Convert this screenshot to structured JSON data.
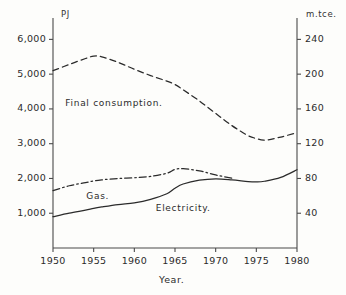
{
  "chart_data": {
    "type": "line",
    "title": "",
    "xlabel": "Year.",
    "ylabel": "PJ",
    "ylabel_right": "m.tce.",
    "xlim": [
      1950,
      1980
    ],
    "ylim": [
      0,
      6500
    ],
    "ylim_right": [
      0,
      260
    ],
    "grid": false,
    "legend": "inline-annotations",
    "xticks": [
      1950,
      1955,
      1960,
      1965,
      1970,
      1975,
      1980
    ],
    "xtick_labels": [
      "1950",
      "1955",
      "1960",
      "1965",
      "1970",
      "1975",
      "1980"
    ],
    "yticks": [
      1000,
      2000,
      3000,
      4000,
      5000,
      6000
    ],
    "ytick_labels": [
      "1,000",
      "2,000",
      "3,000",
      "4,000",
      "5,000",
      "6,000"
    ],
    "yticks_right": [
      40,
      80,
      120,
      160,
      200,
      240
    ],
    "ytick_labels_right": [
      "40",
      "80",
      "120",
      "160",
      "200",
      "240"
    ],
    "x": [
      1950,
      1952,
      1954,
      1955,
      1956,
      1958,
      1960,
      1962,
      1964,
      1965,
      1966,
      1968,
      1970,
      1972,
      1974,
      1975,
      1976,
      1978,
      1980
    ],
    "series": [
      {
        "name": "Final consumption.",
        "style": "dashed",
        "values": [
          5100,
          5280,
          5450,
          5520,
          5500,
          5340,
          5140,
          4960,
          4800,
          4700,
          4550,
          4230,
          3870,
          3520,
          3230,
          3150,
          3100,
          3190,
          3320
        ]
      },
      {
        "name": "Gas.",
        "style": "dash-dot",
        "values": [
          1650,
          1790,
          1880,
          1930,
          1960,
          2000,
          2020,
          2060,
          2150,
          2260,
          2280,
          2220,
          2100,
          2010,
          null,
          null,
          null,
          null,
          null
        ]
      },
      {
        "name": "Electricity.",
        "style": "solid",
        "values": [
          900,
          1000,
          1090,
          1140,
          1180,
          1250,
          1300,
          1400,
          1560,
          1720,
          1840,
          1950,
          1990,
          1960,
          1910,
          1900,
          1920,
          2030,
          2250
        ]
      }
    ],
    "annotations": [
      {
        "text": "Final consumption.",
        "x": 1957.5,
        "y": 4150
      },
      {
        "text": "Gas.",
        "x": 1955.5,
        "y": 1460
      },
      {
        "text": "Electricity.",
        "x": 1966.0,
        "y": 1120
      }
    ]
  },
  "axes": {
    "left_unit": "PJ",
    "right_unit": "m.tce.",
    "x_title": "Year."
  },
  "colors": {
    "line": "#2b2b2b",
    "axis": "#4a4a4a",
    "background": "#fdfdfb"
  }
}
